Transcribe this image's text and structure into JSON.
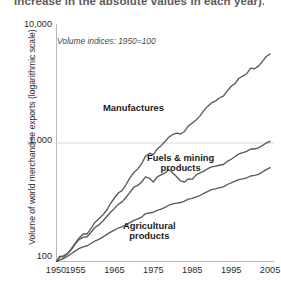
{
  "caption": {
    "text": "increase in the absolute values in each year)."
  },
  "subtitle": "Volume indices: 1950=100",
  "chart_data": {
    "type": "line",
    "title": "",
    "subtitle": "Volume indices: 1950=100",
    "xlabel": "",
    "ylabel": "Volume of world merchandise exports (logarithmic scale)",
    "yscale": "log",
    "ylim": [
      100,
      10000
    ],
    "xlim": [
      1950,
      2006
    ],
    "y_ticks": [
      "10,000",
      "1,000",
      "100"
    ],
    "y_tick_values": [
      10000,
      1000,
      100
    ],
    "x_ticks": [
      "1950",
      "1955",
      "1965",
      "1975",
      "1985",
      "1995",
      "2005"
    ],
    "x_tick_values": [
      1950,
      1955,
      1965,
      1975,
      1985,
      1995,
      2005
    ],
    "x_minor_tick_interval": 1,
    "grid": "horizontal-at-1000",
    "legend_position": "inline-annotations",
    "line_color": "#5a5a5a",
    "axis_color": "#b9b9b9",
    "grid_color": "#d8d8d8",
    "series": [
      {
        "name": "Manufactures",
        "label_position": "inline",
        "x": [
          1950,
          1951,
          1952,
          1953,
          1954,
          1955,
          1956,
          1957,
          1958,
          1959,
          1960,
          1961,
          1962,
          1963,
          1964,
          1965,
          1966,
          1967,
          1968,
          1969,
          1970,
          1971,
          1972,
          1973,
          1974,
          1975,
          1976,
          1977,
          1978,
          1979,
          1980,
          1981,
          1982,
          1983,
          1984,
          1985,
          1986,
          1987,
          1988,
          1989,
          1990,
          1991,
          1992,
          1993,
          1994,
          1995,
          1996,
          1997,
          1998,
          1999,
          2000,
          2001,
          2002,
          2003,
          2004,
          2005
        ],
        "values": [
          100,
          112,
          110,
          118,
          130,
          145,
          160,
          172,
          172,
          192,
          215,
          231,
          248,
          272,
          310,
          345,
          380,
          400,
          448,
          510,
          565,
          605,
          670,
          775,
          820,
          800,
          890,
          950,
          1030,
          1120,
          1180,
          1210,
          1190,
          1250,
          1390,
          1470,
          1560,
          1690,
          1880,
          2040,
          2180,
          2260,
          2400,
          2480,
          2740,
          3000,
          3170,
          3500,
          3650,
          3820,
          4260,
          4210,
          4430,
          4820,
          5330,
          5600
        ]
      },
      {
        "name": "Fuels & mining products",
        "label_position": "inline",
        "x": [
          1950,
          1951,
          1952,
          1953,
          1954,
          1955,
          1956,
          1957,
          1958,
          1959,
          1960,
          1961,
          1962,
          1963,
          1964,
          1965,
          1966,
          1967,
          1968,
          1969,
          1970,
          1971,
          1972,
          1973,
          1974,
          1975,
          1976,
          1977,
          1978,
          1979,
          1980,
          1981,
          1982,
          1983,
          1984,
          1985,
          1986,
          1987,
          1988,
          1989,
          1990,
          1991,
          1992,
          1993,
          1994,
          1995,
          1996,
          1997,
          1998,
          1999,
          2000,
          2001,
          2002,
          2003,
          2004,
          2005
        ],
        "values": [
          100,
          110,
          113,
          118,
          128,
          142,
          155,
          162,
          163,
          178,
          195,
          205,
          220,
          240,
          262,
          282,
          305,
          320,
          350,
          385,
          425,
          440,
          470,
          520,
          505,
          470,
          520,
          540,
          560,
          600,
          560,
          520,
          480,
          470,
          500,
          495,
          540,
          560,
          580,
          610,
          630,
          640,
          650,
          660,
          700,
          730,
          770,
          810,
          830,
          850,
          890,
          890,
          910,
          950,
          1000,
          1030
        ]
      },
      {
        "name": "Agricultural products",
        "label_position": "inline",
        "x": [
          1950,
          1951,
          1952,
          1953,
          1954,
          1955,
          1956,
          1957,
          1958,
          1959,
          1960,
          1961,
          1962,
          1963,
          1964,
          1965,
          1966,
          1967,
          1968,
          1969,
          1970,
          1971,
          1972,
          1973,
          1974,
          1975,
          1976,
          1977,
          1978,
          1979,
          1980,
          1981,
          1982,
          1983,
          1984,
          1985,
          1986,
          1987,
          1988,
          1989,
          1990,
          1991,
          1992,
          1993,
          1994,
          1995,
          1996,
          1997,
          1998,
          1999,
          2000,
          2001,
          2002,
          2003,
          2004,
          2005
        ],
        "values": [
          100,
          104,
          107,
          112,
          118,
          124,
          130,
          134,
          137,
          143,
          150,
          155,
          162,
          170,
          178,
          185,
          193,
          198,
          205,
          214,
          224,
          230,
          238,
          255,
          258,
          262,
          272,
          278,
          288,
          300,
          308,
          312,
          316,
          325,
          338,
          342,
          352,
          362,
          378,
          392,
          405,
          412,
          422,
          428,
          448,
          462,
          478,
          492,
          500,
          510,
          528,
          535,
          545,
          570,
          598,
          620
        ]
      }
    ]
  },
  "annotations": {
    "manufactures": "Manufactures",
    "fuels_line1": "Fuels & mining",
    "fuels_line2": "products",
    "agricultural_line1": "Agricultural",
    "agricultural_line2": "products"
  }
}
